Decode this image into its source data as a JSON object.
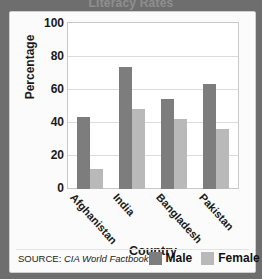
{
  "chart_data": {
    "type": "bar",
    "title": "Literacy Rates",
    "xlabel": "Country",
    "ylabel": "Percentage",
    "categories": [
      "Afghanistan",
      "India",
      "Bangladesh",
      "Pakistan"
    ],
    "series": [
      {
        "name": "Male",
        "color": "#7d7d7d",
        "values": [
          43,
          73,
          54,
          63
        ]
      },
      {
        "name": "Female",
        "color": "#b9b9b9",
        "values": [
          12,
          48,
          42,
          36
        ]
      }
    ],
    "ylim": [
      0,
      100
    ],
    "yticks": [
      100,
      80,
      60,
      40,
      20,
      0
    ],
    "grid": true,
    "legend_position": "bottom-right",
    "source_prefix": "SOURCE:",
    "source_name": "CIA World Factbook"
  }
}
